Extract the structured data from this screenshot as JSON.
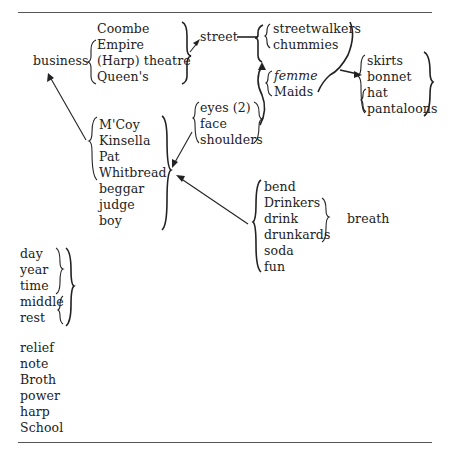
{
  "diagram": {
    "type": "word-association network",
    "groups": {
      "business": "business",
      "theatres": [
        "Coombe",
        "Empire",
        "(Harp) theatre",
        "Queen's"
      ],
      "street": "street",
      "street_group": [
        "streetwalkers",
        "chummies"
      ],
      "maids_group": [
        "femme",
        "Maids"
      ],
      "clothes": [
        "skirts",
        "bonnet",
        "hat",
        "pantaloons"
      ],
      "people": [
        "M'Coy",
        "Kinsella",
        "Pat",
        "Whitbread",
        "beggar",
        "judge",
        "boy"
      ],
      "body": [
        "eyes (2)",
        "face",
        "shoulders"
      ],
      "drink": [
        "bend",
        "Drinkers",
        "drink",
        "drunkards",
        "soda",
        "fun"
      ],
      "breath": "breath",
      "time": [
        "day",
        "year",
        "time",
        "middle",
        "rest"
      ],
      "misc": [
        "relief",
        "note",
        "Broth",
        "power",
        "harp",
        "School"
      ]
    },
    "arrows": [
      {
        "from": "theatres",
        "to": "street"
      },
      {
        "from": "street",
        "to": "street_group"
      },
      {
        "from": "body",
        "to": "maids_group"
      },
      {
        "from": "street_group/maids_group",
        "to": "clothes"
      },
      {
        "from": "people",
        "to": "business"
      },
      {
        "from": "body",
        "to": "people"
      },
      {
        "from": "drink",
        "to": "people"
      }
    ]
  }
}
